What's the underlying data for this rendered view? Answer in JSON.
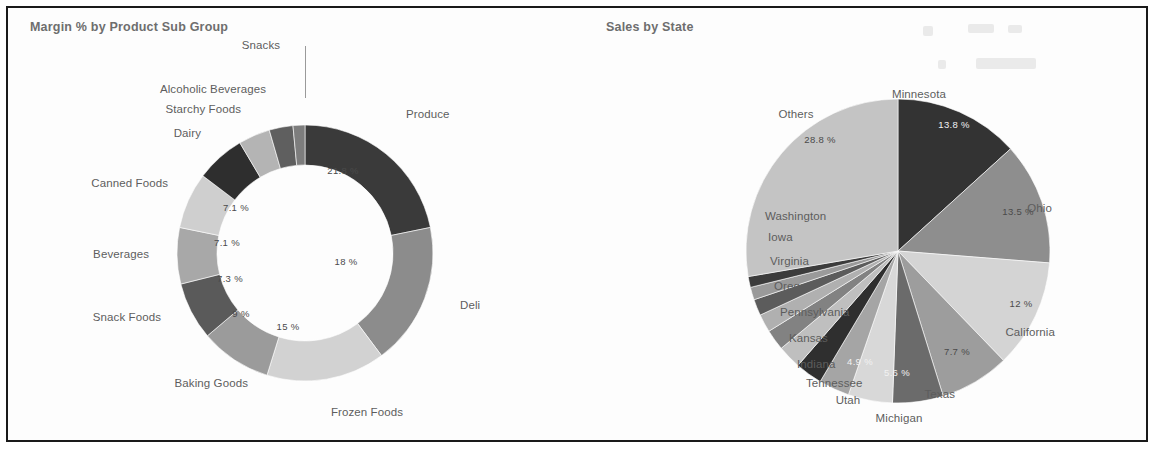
{
  "frame": {
    "border_color": "#1a1a1a",
    "background": "#ffffff"
  },
  "panels": [
    {
      "id": "margin",
      "title": "Margin % by Product Sub Group"
    },
    {
      "id": "sales",
      "title": "Sales by State"
    }
  ],
  "chart_data": [
    {
      "type": "pie",
      "variant": "donut",
      "title": "Margin % by Product Sub Group",
      "xlabel": "",
      "ylabel": "",
      "legend": "none",
      "labels_position": "outside",
      "value_suffix": "%",
      "categories": [
        "Produce",
        "Deli",
        "Frozen Foods",
        "Baking Goods",
        "Snack Foods",
        "Beverages",
        "Canned Foods",
        "Dairy",
        "Starchy Foods",
        "Alcoholic Beverages",
        "Snacks"
      ],
      "values": [
        21.8,
        18,
        15,
        9,
        7.3,
        7.1,
        7.1,
        6.2,
        4.0,
        3.0,
        1.5
      ],
      "value_labels": [
        "21.8 %",
        "18 %",
        "15 %",
        "9 %",
        "7.3 %",
        "7.1 %",
        "7.1 %",
        "",
        "",
        "",
        ""
      ],
      "slice_colors": [
        "#3a3a3a",
        "#8c8c8c",
        "#d2d2d2",
        "#9b9b9b",
        "#5a5a5a",
        "#a8a8a8",
        "#cfcfcf",
        "#2e2e2e",
        "#b4b4b4",
        "#5f5f5f",
        "#7d7d7d"
      ]
    },
    {
      "type": "pie",
      "variant": "pie",
      "title": "Sales by State",
      "xlabel": "",
      "ylabel": "",
      "legend": "none",
      "labels_position": "outside",
      "value_suffix": "%",
      "categories": [
        "Minnesota",
        "Ohio",
        "California",
        "Texas",
        "Michigan",
        "Utah",
        "Tennessee",
        "Indiana",
        "Kansas",
        "Pennsylvania",
        "Oregon",
        "Virginia",
        "Iowa",
        "Washington",
        "Others"
      ],
      "values": [
        13.8,
        13.5,
        12,
        7.7,
        5.6,
        4.9,
        3.4,
        3.0,
        2.6,
        2.3,
        2.0,
        1.8,
        1.4,
        1.2,
        28.8
      ],
      "value_labels": [
        "13.8 %",
        "13.5 %",
        "12 %",
        "7.7 %",
        "5.6 %",
        "4.9 %",
        "",
        "",
        "",
        "",
        "",
        "",
        "",
        "",
        "28.8 %"
      ],
      "slice_colors": [
        "#333333",
        "#8e8e8e",
        "#d4d4d4",
        "#9d9d9d",
        "#6b6b6b",
        "#d8d8d8",
        "#a5a5a5",
        "#2f2f2f",
        "#bfbfbf",
        "#828282",
        "#b0b0b0",
        "#5c5c5c",
        "#9a9a9a",
        "#3c3c3c",
        "#c4c4c4"
      ]
    }
  ],
  "margin_chart": {
    "outside_labels": [
      {
        "text": "Snacks",
        "x": 253,
        "y": 31,
        "align": "center"
      },
      {
        "text": "Alcoholic Beverages",
        "x": 258,
        "y": 75,
        "align": "left"
      },
      {
        "text": "Starchy Foods",
        "x": 233,
        "y": 95,
        "align": "left"
      },
      {
        "text": "Dairy",
        "x": 193,
        "y": 119,
        "align": "left"
      },
      {
        "text": "Canned Foods",
        "x": 160,
        "y": 169,
        "align": "left"
      },
      {
        "text": "Beverages",
        "x": 141,
        "y": 240,
        "align": "left"
      },
      {
        "text": "Snack Foods",
        "x": 153,
        "y": 303,
        "align": "left"
      },
      {
        "text": "Baking Goods",
        "x": 240,
        "y": 369,
        "align": "left"
      },
      {
        "text": "Frozen Foods",
        "x": 359,
        "y": 398,
        "align": "center"
      },
      {
        "text": "Deli",
        "x": 452,
        "y": 291,
        "align": "right"
      },
      {
        "text": "Produce",
        "x": 398,
        "y": 100,
        "align": "right"
      }
    ],
    "value_labels": [
      {
        "text": "21.8 %",
        "x": 335,
        "y": 162,
        "tone": "dark"
      },
      {
        "text": "18 %",
        "x": 338,
        "y": 253,
        "tone": "dark"
      },
      {
        "text": "15 %",
        "x": 280,
        "y": 318,
        "tone": "dark"
      },
      {
        "text": "9 %",
        "x": 233,
        "y": 305,
        "tone": "dark"
      },
      {
        "text": "7.3 %",
        "x": 222,
        "y": 270,
        "tone": "dark"
      },
      {
        "text": "7.1 %",
        "x": 219,
        "y": 234,
        "tone": "dark"
      },
      {
        "text": "7.1 %",
        "x": 228,
        "y": 199,
        "tone": "dark"
      }
    ]
  },
  "sales_chart": {
    "outside_labels": [
      {
        "text": "Minnesota",
        "x": 938,
        "y": 80,
        "align": "left"
      },
      {
        "text": "Ohio",
        "x": 1044,
        "y": 194,
        "align": "left"
      },
      {
        "text": "California",
        "x": 1047,
        "y": 318,
        "align": "left"
      },
      {
        "text": "Texas",
        "x": 947,
        "y": 380,
        "align": "left"
      },
      {
        "text": "Michigan",
        "x": 891,
        "y": 404,
        "align": "center"
      },
      {
        "text": "Utah",
        "x": 840,
        "y": 386,
        "align": "center"
      },
      {
        "text": "Tennessee",
        "x": 798,
        "y": 369,
        "align": "right"
      },
      {
        "text": "Indiana",
        "x": 789,
        "y": 350,
        "align": "right"
      },
      {
        "text": "Kansas",
        "x": 781,
        "y": 324,
        "align": "right"
      },
      {
        "text": "Pennsylvania",
        "x": 772,
        "y": 298,
        "align": "right"
      },
      {
        "text": "Oregon",
        "x": 766,
        "y": 272,
        "align": "right"
      },
      {
        "text": "Virginia",
        "x": 762,
        "y": 247,
        "align": "right"
      },
      {
        "text": "Iowa",
        "x": 760,
        "y": 223,
        "align": "right"
      },
      {
        "text": "Washington",
        "x": 757,
        "y": 202,
        "align": "right"
      },
      {
        "text": "Others",
        "x": 788,
        "y": 100,
        "align": "center"
      }
    ],
    "value_labels": [
      {
        "text": "13.8 %",
        "x": 946,
        "y": 116,
        "tone": "light"
      },
      {
        "text": "13.5 %",
        "x": 1010,
        "y": 203,
        "tone": "dark"
      },
      {
        "text": "12 %",
        "x": 1013,
        "y": 295,
        "tone": "dark"
      },
      {
        "text": "7.7 %",
        "x": 949,
        "y": 343,
        "tone": "dark"
      },
      {
        "text": "5.6 %",
        "x": 889,
        "y": 364,
        "tone": "light"
      },
      {
        "text": "4.9 %",
        "x": 852,
        "y": 353,
        "tone": "light"
      },
      {
        "text": "28.8 %",
        "x": 812,
        "y": 131,
        "tone": "dark"
      }
    ]
  }
}
